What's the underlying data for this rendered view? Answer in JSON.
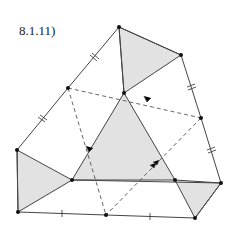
{
  "figure": {
    "label": "8.1.11)",
    "colors": {
      "shade": "#e2e2e2",
      "line": "#444444",
      "point": "#111111"
    },
    "points": {
      "A": [
        119,
        27
      ],
      "B": [
        181,
        55
      ],
      "C": [
        201,
        118
      ],
      "D": [
        221,
        183
      ],
      "E": [
        195,
        218
      ],
      "F": [
        106,
        215
      ],
      "G": [
        18,
        212
      ],
      "H": [
        17,
        150
      ],
      "I": [
        68,
        88
      ],
      "J": [
        124,
        93
      ],
      "K": [
        72,
        180
      ],
      "L": [
        175,
        180
      ]
    },
    "outer_polygon": [
      "A",
      "B",
      "C",
      "D",
      "E",
      "F",
      "G",
      "H",
      "I"
    ],
    "shaded_triangles": [
      [
        "A",
        "B",
        "J"
      ],
      [
        "J",
        "K",
        "L"
      ],
      [
        "H",
        "K",
        "G"
      ],
      [
        "L",
        "D",
        "E"
      ]
    ],
    "dashed_segments": [
      [
        "I",
        "J"
      ],
      [
        "J",
        "C"
      ],
      [
        "I",
        "F"
      ],
      [
        "C",
        "F"
      ]
    ]
  }
}
